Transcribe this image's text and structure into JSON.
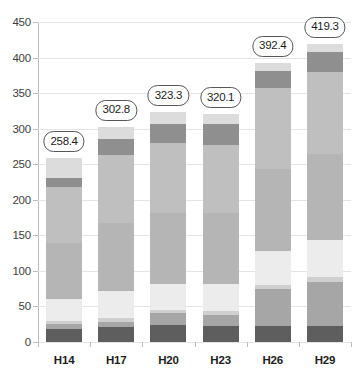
{
  "chart_data": {
    "type": "bar",
    "stacked": true,
    "title": "",
    "xlabel": "",
    "ylabel": "",
    "ylim": [
      0,
      450
    ],
    "ytick_step": 50,
    "yticks": [
      0,
      50,
      100,
      150,
      200,
      250,
      300,
      350,
      400,
      450
    ],
    "grid": true,
    "legend": "none",
    "categories": [
      "H14",
      "H17",
      "H20",
      "H23",
      "H26",
      "H29"
    ],
    "totals": [
      258.4,
      302.8,
      323.3,
      320.1,
      392.4,
      419.3
    ],
    "total_labels": [
      "258.4",
      "302.8",
      "323.3",
      "320.1",
      "392.4",
      "419.3"
    ],
    "series": [
      {
        "name": "segment-1",
        "color": "#5e5e5e",
        "values": [
          19.0,
          21.0,
          24.0,
          22.0,
          22.0,
          23.0
        ]
      },
      {
        "name": "segment-2",
        "color": "#a6a6a6",
        "values": [
          6.0,
          7.0,
          17.0,
          16.0,
          53.0,
          62.0
        ]
      },
      {
        "name": "segment-3",
        "color": "#cfcfcf",
        "values": [
          5.0,
          6.0,
          4.0,
          5.0,
          5.0,
          6.0
        ]
      },
      {
        "name": "segment-4",
        "color": "#ececec",
        "values": [
          31.0,
          38.0,
          37.0,
          39.0,
          48.0,
          52.0
        ]
      },
      {
        "name": "segment-5",
        "color": "#b5b5b5",
        "values": [
          78.0,
          95.0,
          99.0,
          99.0,
          115.0,
          121.0
        ]
      },
      {
        "name": "segment-6",
        "color": "#bfbfbf",
        "values": [
          79.4,
          95.8,
          99.3,
          96.1,
          114.4,
          116.3
        ]
      },
      {
        "name": "segment-7",
        "color": "#8f8f8f",
        "values": [
          13.0,
          23.0,
          27.0,
          29.0,
          24.0,
          28.0
        ]
      },
      {
        "name": "segment-8",
        "color": "#dcdcdc",
        "values": [
          27.0,
          17.0,
          16.0,
          14.0,
          11.0,
          11.0
        ]
      }
    ],
    "axis_color": "#b9bcc0",
    "grid_color": "#e2e4e7",
    "label_color": "#1d1d1d",
    "pill_border_color": "#58585a",
    "background": "#ffffff"
  }
}
